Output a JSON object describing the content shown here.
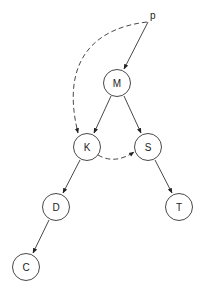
{
  "diagram": {
    "pointer": {
      "label": "p",
      "x": 152,
      "y": 13
    },
    "nodes": [
      {
        "id": "M",
        "label": "M",
        "x": 117,
        "y": 83
      },
      {
        "id": "K",
        "label": "K",
        "x": 87,
        "y": 147
      },
      {
        "id": "S",
        "label": "S",
        "x": 148,
        "y": 147
      },
      {
        "id": "D",
        "label": "D",
        "x": 56,
        "y": 207
      },
      {
        "id": "T",
        "label": "T",
        "x": 179,
        "y": 207
      },
      {
        "id": "C",
        "label": "C",
        "x": 26,
        "y": 267
      }
    ],
    "edges": [
      {
        "from": "p",
        "to": "M",
        "style": "solid"
      },
      {
        "from": "M",
        "to": "K",
        "style": "solid"
      },
      {
        "from": "M",
        "to": "S",
        "style": "solid"
      },
      {
        "from": "K",
        "to": "D",
        "style": "solid"
      },
      {
        "from": "S",
        "to": "T",
        "style": "solid"
      },
      {
        "from": "D",
        "to": "C",
        "style": "solid"
      },
      {
        "from": "p",
        "to": "K",
        "style": "dashed"
      },
      {
        "from": "K",
        "to": "S",
        "style": "dashed"
      }
    ]
  }
}
